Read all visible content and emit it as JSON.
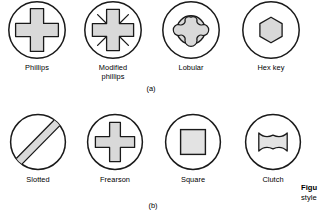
{
  "figure": {
    "panels": [
      {
        "id": "panel-a",
        "tag": "(a)",
        "items": [
          {
            "name": "phillips",
            "label": "Phillips",
            "icon": "phillips-drive-icon"
          },
          {
            "name": "modified-phillips",
            "label": "Modified\nphillips",
            "icon": "modified-phillips-drive-icon"
          },
          {
            "name": "lobular",
            "label": "Lobular",
            "icon": "lobular-drive-icon"
          },
          {
            "name": "hex-key",
            "label": "Hex key",
            "icon": "hex-key-drive-icon"
          }
        ]
      },
      {
        "id": "panel-b",
        "tag": "(b)",
        "items": [
          {
            "name": "slotted",
            "label": "Slotted",
            "icon": "slotted-drive-icon"
          },
          {
            "name": "frearson",
            "label": "Frearson",
            "icon": "frearson-drive-icon"
          },
          {
            "name": "square",
            "label": "Square",
            "icon": "square-drive-icon"
          },
          {
            "name": "clutch",
            "label": "Clutch",
            "icon": "clutch-drive-icon"
          }
        ]
      }
    ],
    "caption": {
      "lead": "Figu",
      "body": "style"
    },
    "colors": {
      "outline": "#1a1a1a",
      "fill": "#d9d9d9",
      "background": "#ffffff"
    }
  }
}
